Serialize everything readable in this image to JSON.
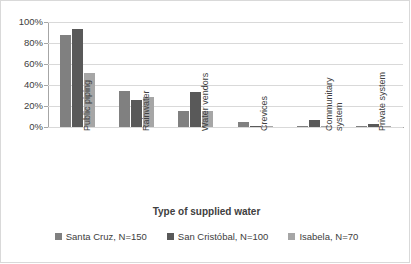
{
  "chart_data": {
    "type": "bar",
    "title": "",
    "xlabel": "Type of supplied water",
    "ylabel": "",
    "ylim": [
      0,
      100
    ],
    "yticks": [
      "0%",
      "20%",
      "40%",
      "60%",
      "80%",
      "100%"
    ],
    "ytick_values": [
      0,
      20,
      40,
      60,
      80,
      100
    ],
    "grid": true,
    "legend_position": "bottom",
    "categories": [
      "Public piping",
      "Rainwater",
      "Water vendors",
      "Crevices",
      "Communitary\nsystem",
      "Private system"
    ],
    "series": [
      {
        "name": "Santa Cruz, N=150",
        "color": "#808080",
        "values": [
          88,
          34,
          15,
          5,
          1,
          1
        ]
      },
      {
        "name": "San Cristóbal, N=100",
        "color": "#595959",
        "values": [
          93,
          26,
          33,
          1,
          7,
          3
        ]
      },
      {
        "name": "Isabela, N=70",
        "color": "#a6a6a6",
        "values": [
          51,
          29,
          15,
          1,
          1,
          1
        ]
      }
    ]
  },
  "axis": {
    "x_title": "Type of supplied water"
  },
  "legend": {
    "items": [
      {
        "label": "Santa Cruz, N=150",
        "color": "#808080"
      },
      {
        "label": "San Cristóbal, N=100",
        "color": "#595959"
      },
      {
        "label": "Isabela, N=70",
        "color": "#a6a6a6"
      }
    ]
  },
  "colors": {
    "series_1": "#808080",
    "series_2": "#595959",
    "series_3": "#a6a6a6",
    "gridline": "#d9d9d9",
    "axis": "#a6a6a6",
    "text": "#404040",
    "background": "#ffffff"
  }
}
